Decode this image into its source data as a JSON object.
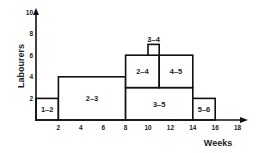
{
  "chart_data": {
    "type": "bar",
    "subtype": "resource-histogram",
    "title": "",
    "xlabel": "Weeks",
    "ylabel": "Labourers",
    "xlim": [
      0,
      18
    ],
    "ylim": [
      0,
      10
    ],
    "x_ticks": [
      2,
      4,
      6,
      8,
      10,
      12,
      14,
      16,
      18
    ],
    "y_ticks": [
      2,
      4,
      6,
      8,
      10
    ],
    "grid": false,
    "activities": [
      {
        "label": "1–2",
        "x_start": 0,
        "x_end": 2,
        "y_bottom": 0,
        "y_top": 2
      },
      {
        "label": "2–3",
        "x_start": 2,
        "x_end": 8,
        "y_bottom": 0,
        "y_top": 4
      },
      {
        "label": "3–5",
        "x_start": 8,
        "x_end": 14,
        "y_bottom": 0,
        "y_top": 3
      },
      {
        "label": "2–4",
        "x_start": 8,
        "x_end": 11,
        "y_bottom": 3,
        "y_top": 6
      },
      {
        "label": "4–5",
        "x_start": 11,
        "x_end": 14,
        "y_bottom": 3,
        "y_top": 6
      },
      {
        "label": "3–4",
        "x_start": 10,
        "x_end": 11,
        "y_bottom": 6,
        "y_top": 7,
        "label_above": true
      },
      {
        "label": "5–6",
        "x_start": 14,
        "x_end": 16,
        "y_bottom": 0,
        "y_top": 2
      }
    ]
  }
}
